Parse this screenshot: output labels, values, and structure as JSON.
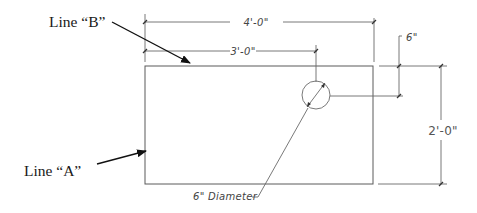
{
  "labels": {
    "line_b": "Line “B”",
    "line_a": "Line “A”",
    "dim_overall_width": "4'-0\"",
    "dim_hole_offset_x": "3'-0\"",
    "dim_hole_offset_y": "6\"",
    "dim_overall_height": "2'-0\"",
    "hole_note": "6\" Diameter"
  },
  "colors": {
    "line": "#5a5a5a",
    "arrow": "#111111",
    "text": "#1a1a1a",
    "background": "#ffffff"
  }
}
